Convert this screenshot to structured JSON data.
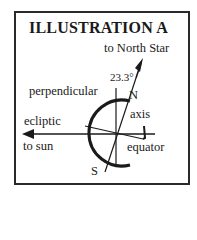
{
  "title": "ILLUSTRATION A",
  "labels": {
    "north_star": "to North Star",
    "angle": "23.3°",
    "perpendicular": "perpendicular",
    "north": "N",
    "axis": "axis",
    "ecliptic": "ecliptic",
    "to_sun": "to sun",
    "equator": "equator",
    "south": "S"
  },
  "colors": {
    "ink": "#1a1a1a",
    "background": "#ffffff"
  }
}
